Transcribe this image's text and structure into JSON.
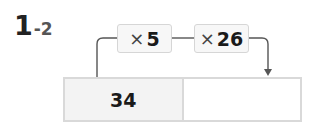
{
  "problem": {
    "major": "1",
    "minor": "-2"
  },
  "operations": [
    {
      "symbol": "×",
      "value": "5"
    },
    {
      "symbol": "×",
      "value": "26"
    }
  ],
  "table": {
    "cells": [
      "34",
      ""
    ]
  },
  "colors": {
    "line": "#555555",
    "box_border": "#d6d6d6",
    "box_fill": "#f7f7f7",
    "cell_fill": "#f3f3f3"
  }
}
